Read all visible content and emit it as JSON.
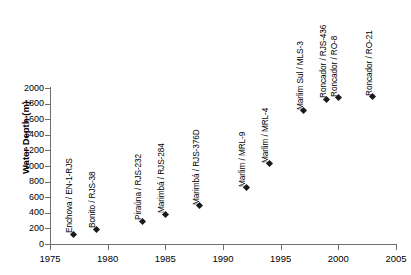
{
  "chart_data": {
    "type": "scatter",
    "title": "",
    "xlabel": "",
    "ylabel": "Water Depth (m)",
    "xlim": [
      1975,
      2005
    ],
    "ylim": [
      0,
      2000
    ],
    "grid": false,
    "legend": "none",
    "xticks": [
      "1975",
      "1980",
      "1985",
      "1990",
      "1995",
      "2000",
      "2005"
    ],
    "yticks": [
      "0",
      "200",
      "400",
      "600",
      "800",
      "1000",
      "1200",
      "1400",
      "1600",
      "1800",
      "2000"
    ],
    "x": [
      1977,
      1979,
      1983,
      1985,
      1988,
      1992,
      1994,
      1997,
      1999,
      2000,
      2003
    ],
    "values": [
      124,
      189,
      293,
      383,
      492,
      721,
      1027,
      1709,
      1853,
      1877,
      1886
    ],
    "labels": [
      "Enchova / EN-1-RJS",
      "Bonito / RJS-38",
      "Piraúna / RJS-232",
      "Marimbá / RJS-284",
      "Marimbá / RJS-376D",
      "Marlim / MRL-9",
      "Marlim / MRL-4",
      "Marlim Sul / MLS-3",
      "Roncador / RJS-436",
      "Roncador / RO-8",
      "Roncador / RO-21"
    ],
    "points": [
      {
        "label": "Enchova / EN-1-RJS",
        "x": 1977,
        "y": 124
      },
      {
        "label": "Bonito / RJS-38",
        "x": 1979,
        "y": 189
      },
      {
        "label": "Piraúna / RJS-232",
        "x": 1983,
        "y": 293
      },
      {
        "label": "Marimbá / RJS-284",
        "x": 1985,
        "y": 383
      },
      {
        "label": "Marimbá / RJS-376D",
        "x": 1988,
        "y": 492
      },
      {
        "label": "Marlim / MRL-9",
        "x": 1992,
        "y": 721
      },
      {
        "label": "Marlim / MRL-4",
        "x": 1994,
        "y": 1027
      },
      {
        "label": "Marlim Sul / MLS-3",
        "x": 1997,
        "y": 1709
      },
      {
        "label": "Roncador / RJS-436",
        "x": 1999,
        "y": 1853
      },
      {
        "label": "Roncador / RO-8",
        "x": 2000,
        "y": 1877
      },
      {
        "label": "Roncador / RO-21",
        "x": 2003,
        "y": 1886
      }
    ],
    "colors": {
      "marker": "#1a1a1a",
      "axis": "#6e6e6e",
      "text": "#000000",
      "background": "#ffffff"
    }
  }
}
